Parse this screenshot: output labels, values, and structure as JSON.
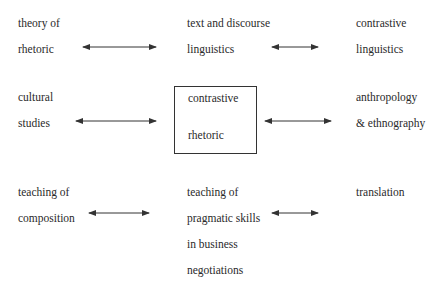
{
  "diagram": {
    "nodes": {
      "theory_of_rhetoric": {
        "lines": [
          "theory of",
          "rhetoric"
        ]
      },
      "text_discourse_linguistics": {
        "lines": [
          "text and discourse",
          "linguistics"
        ]
      },
      "contrastive_linguistics": {
        "lines": [
          "contrastive",
          "linguistics"
        ]
      },
      "cultural_studies": {
        "lines": [
          "cultural",
          "studies"
        ]
      },
      "contrastive_rhetoric": {
        "lines": [
          "contrastive",
          "rhetoric"
        ]
      },
      "anthropology_ethnography": {
        "lines": [
          "anthropology",
          "& ethnography"
        ]
      },
      "teaching_composition": {
        "lines": [
          "teaching of",
          "composition"
        ]
      },
      "teaching_pragmatic": {
        "lines": [
          "teaching of",
          "pragmatic skills",
          "in business",
          "negotiations"
        ]
      },
      "translation": {
        "lines": [
          "translation"
        ]
      }
    },
    "edges": [
      {
        "from": "theory_of_rhetoric",
        "to": "text_discourse_linguistics",
        "type": "bidirectional"
      },
      {
        "from": "text_discourse_linguistics",
        "to": "contrastive_linguistics",
        "type": "bidirectional"
      },
      {
        "from": "cultural_studies",
        "to": "contrastive_rhetoric",
        "type": "bidirectional"
      },
      {
        "from": "contrastive_rhetoric",
        "to": "anthropology_ethnography",
        "type": "bidirectional"
      },
      {
        "from": "teaching_composition",
        "to": "teaching_pragmatic",
        "type": "bidirectional"
      },
      {
        "from": "teaching_pragmatic",
        "to": "translation",
        "type": "bidirectional"
      }
    ]
  }
}
